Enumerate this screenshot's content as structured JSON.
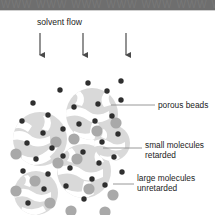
{
  "figure": {
    "title": "solvent flow",
    "domain": "size exclusion chromatography schematic"
  },
  "banner": {
    "watermark_text": "WWW WWW WWW WWW WWW WWW WWW"
  },
  "labels": {
    "solvent_flow": "solvent flow",
    "porous_beads": "porous beads",
    "small_molecules_line1": "small molecules",
    "small_molecules_line2": "retarded",
    "large_molecules_line1": "large molecules",
    "large_molecules_line2": "unretarded"
  },
  "colors": {
    "background": "#ffffff",
    "banner": "#6e6e6e",
    "bead_fill": "#d9d9d9",
    "bead_pore": "#ffffff",
    "small_molecule": "#2f2f2f",
    "large_molecule": "#a9a9a9",
    "arrow": "#4a4a4a",
    "leader_line": "#8c8c8c",
    "text": "#1b1b1b"
  },
  "arrows": [
    {
      "name": "solvent-arrow-left",
      "x": 40,
      "y_top": 33,
      "y_bottom": 53
    },
    {
      "name": "solvent-arrow-center",
      "x": 83,
      "y_top": 33,
      "y_bottom": 53
    },
    {
      "name": "solvent-arrow-right",
      "x": 126,
      "y_top": 33,
      "y_bottom": 53
    }
  ],
  "beads": [
    {
      "name": "bead-1",
      "cx": 40,
      "cy": 128,
      "r": 27,
      "rotate": 10
    },
    {
      "name": "bead-2",
      "cx": 92,
      "cy": 103,
      "r": 26,
      "rotate": 115
    },
    {
      "name": "bead-3",
      "cx": 84,
      "cy": 160,
      "r": 27,
      "rotate": 200
    },
    {
      "name": "bead-4",
      "cx": 36,
      "cy": 182,
      "r": 22,
      "rotate": 300
    },
    {
      "name": "bead-5",
      "cx": 112,
      "cy": 132,
      "r": 18,
      "rotate": 45
    }
  ],
  "small_molecules": [
    {
      "cx": 33,
      "cy": 92
    },
    {
      "cx": 60,
      "cy": 79
    },
    {
      "cx": 22,
      "cy": 110
    },
    {
      "cx": 48,
      "cy": 104
    },
    {
      "cx": 88,
      "cy": 72
    },
    {
      "cx": 74,
      "cy": 96
    },
    {
      "cx": 107,
      "cy": 80
    },
    {
      "cx": 121,
      "cy": 70
    },
    {
      "cx": 121,
      "cy": 89
    },
    {
      "cx": 98,
      "cy": 93
    },
    {
      "cx": 63,
      "cy": 118
    },
    {
      "cx": 43,
      "cy": 122
    },
    {
      "cx": 27,
      "cy": 132
    },
    {
      "cx": 52,
      "cy": 137
    },
    {
      "cx": 79,
      "cy": 113
    },
    {
      "cx": 95,
      "cy": 110
    },
    {
      "cx": 112,
      "cy": 105
    },
    {
      "cx": 118,
      "cy": 123
    },
    {
      "cx": 102,
      "cy": 131
    },
    {
      "cx": 36,
      "cy": 148
    },
    {
      "cx": 63,
      "cy": 145
    },
    {
      "cx": 83,
      "cy": 141
    },
    {
      "cx": 23,
      "cy": 160
    },
    {
      "cx": 48,
      "cy": 163
    },
    {
      "cx": 70,
      "cy": 157
    },
    {
      "cx": 99,
      "cy": 152
    },
    {
      "cx": 114,
      "cy": 146
    },
    {
      "cx": 122,
      "cy": 161
    },
    {
      "cx": 92,
      "cy": 168
    },
    {
      "cx": 66,
      "cy": 175
    },
    {
      "cx": 44,
      "cy": 178
    },
    {
      "cx": 105,
      "cy": 174
    },
    {
      "cx": 84,
      "cy": 188
    },
    {
      "cx": 28,
      "cy": 192
    }
  ],
  "large_molecules": [
    {
      "cx": 74,
      "cy": 128
    },
    {
      "cx": 97,
      "cy": 120
    },
    {
      "cx": 116,
      "cy": 112
    },
    {
      "cx": 16,
      "cy": 143
    },
    {
      "cx": 56,
      "cy": 131
    },
    {
      "cx": 77,
      "cy": 148
    },
    {
      "cx": 35,
      "cy": 170
    },
    {
      "cx": 58,
      "cy": 152
    },
    {
      "cx": 16,
      "cy": 180
    },
    {
      "cx": 89,
      "cy": 178
    },
    {
      "cx": 50,
      "cy": 192
    },
    {
      "cx": 113,
      "cy": 184
    },
    {
      "cx": 71,
      "cy": 200
    },
    {
      "cx": 105,
      "cy": 201
    }
  ],
  "leaders": [
    {
      "name": "leader-porous-beads",
      "x1": 111,
      "y1": 105,
      "x2": 155,
      "y2": 105
    },
    {
      "name": "leader-small-molecules",
      "x1": 103,
      "y1": 148,
      "x2": 142,
      "y2": 148
    },
    {
      "name": "leader-large-molecules",
      "x1": 113,
      "y1": 184,
      "x2": 134,
      "y2": 184
    }
  ]
}
